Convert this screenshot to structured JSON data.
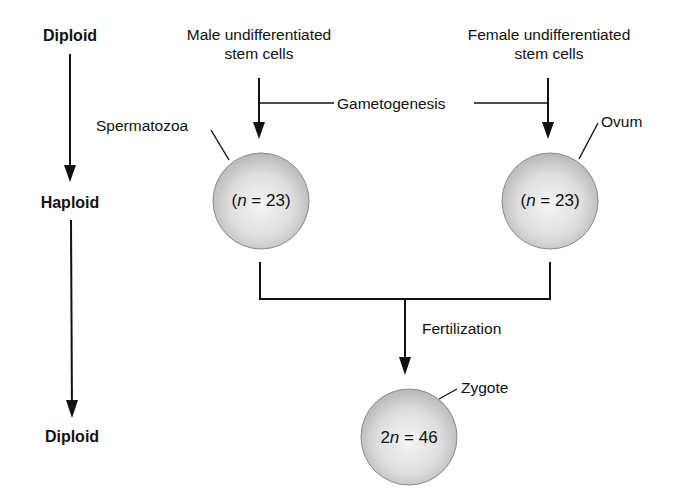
{
  "left_axis": {
    "top": "Diploid",
    "middle": "Haploid",
    "bottom": "Diploid"
  },
  "male": {
    "line1": "Male undifferentiated",
    "line2": "stem cells",
    "gamete_label": "Spermatozoa",
    "cell_prefix": "(",
    "cell_var": "n",
    "cell_rest": " = 23)"
  },
  "female": {
    "line1": "Female undifferentiated",
    "line2": "stem cells",
    "gamete_label": "Ovum",
    "cell_prefix": "(",
    "cell_var": "n",
    "cell_rest": " = 23)"
  },
  "process": {
    "gametogenesis": "Gametogenesis",
    "fertilization": "Fertilization"
  },
  "zygote": {
    "label": "Zygote",
    "cell_prefix": "2",
    "cell_var": "n",
    "cell_rest": " = 46"
  },
  "colors": {
    "line": "#111111",
    "cell_fill_center": "#f4f4f4",
    "cell_fill_edge": "#bdbdbd",
    "cell_stroke": "#8a8a8a"
  }
}
